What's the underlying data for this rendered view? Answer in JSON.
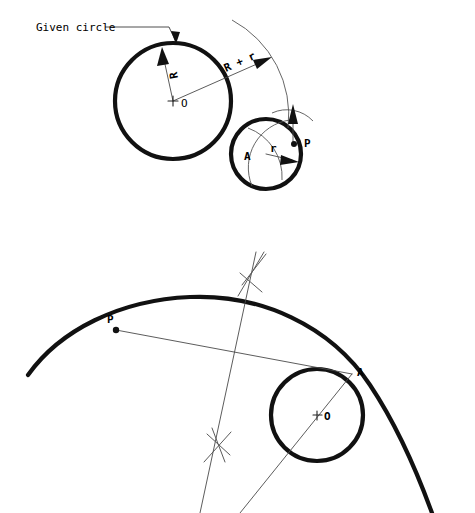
{
  "figure": {
    "background_color": "#ffffff",
    "ink_color": "#111111",
    "construction_color": "#555555"
  },
  "upper_diagram": {
    "name": "tangent-circle-construction-step-1",
    "callout_label": "Given circle",
    "labels": {
      "center_big": "O",
      "radius_big": "R",
      "sum_radius": "R + r",
      "center_small": "A",
      "radius_small": "r",
      "tangent_point": "P"
    },
    "given_circle": {
      "cx": 173,
      "cy": 101,
      "r": 58
    },
    "small_circle": {
      "cx": 266,
      "cy": 154,
      "r": 35
    }
  },
  "lower_diagram": {
    "name": "tangent-circle-construction-step-2",
    "labels": {
      "point_p": "P",
      "point_a": "A",
      "center_o": "O"
    },
    "small_circle": {
      "cx": 317,
      "cy": 415,
      "r": 46
    },
    "point_p": {
      "x": 116,
      "y": 330
    },
    "point_a": {
      "x": 350,
      "y": 375
    },
    "bisector_marks": 2
  }
}
